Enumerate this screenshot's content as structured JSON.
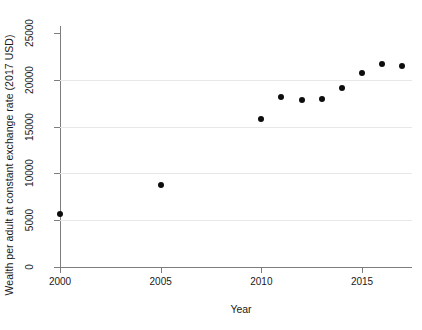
{
  "chart_data": {
    "type": "scatter",
    "title": "",
    "xlabel": "Year",
    "ylabel": "Wealth per adult at constant exchange rate (2017 USD)",
    "xlim": [
      1999,
      2018
    ],
    "ylim": [
      0,
      26500
    ],
    "grid": true,
    "legend": null,
    "xticks": [
      {
        "value": 2000,
        "label": "2000"
      },
      {
        "value": 2005,
        "label": "2005"
      },
      {
        "value": 2010,
        "label": "2010"
      },
      {
        "value": 2015,
        "label": "2015"
      }
    ],
    "yticks": [
      {
        "value": 0,
        "label": "0"
      },
      {
        "value": 5000,
        "label": "5000"
      },
      {
        "value": 10000,
        "label": "10000"
      },
      {
        "value": 15000,
        "label": "15000"
      },
      {
        "value": 20000,
        "label": "20000"
      },
      {
        "value": 25000,
        "label": "25000"
      }
    ],
    "gridlines_y": [
      5000,
      10000,
      15000,
      20000
    ],
    "marker": {
      "shape": "circle",
      "color": "#0d0d0d",
      "size": 6
    },
    "x": [
      2000,
      2005,
      2010,
      2011,
      2012,
      2013,
      2014,
      2015,
      2016,
      2017
    ],
    "y": [
      5700,
      8800,
      15800,
      18200,
      17800,
      18000,
      19100,
      20700,
      21700,
      21500
    ],
    "points": [
      {
        "x": 2000,
        "y": 5700
      },
      {
        "x": 2005,
        "y": 8800
      },
      {
        "x": 2010,
        "y": 15800
      },
      {
        "x": 2011,
        "y": 18200
      },
      {
        "x": 2012,
        "y": 17800
      },
      {
        "x": 2013,
        "y": 18000
      },
      {
        "x": 2014,
        "y": 19100
      },
      {
        "x": 2015,
        "y": 20700
      },
      {
        "x": 2016,
        "y": 21700
      },
      {
        "x": 2017,
        "y": 21500
      }
    ]
  }
}
